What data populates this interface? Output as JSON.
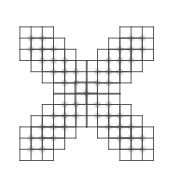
{
  "figure": {
    "canvas": {
      "width": 173,
      "height": 186,
      "background_color": "#ffffff"
    },
    "style": {
      "line_color": "#4a4a4a",
      "line_width": 0.9,
      "dot_color": "#8a8a8a",
      "dot_radius": 2.2,
      "dot_blur": 1.6,
      "cell_size": 11.2
    },
    "center_block": {
      "name": "center-2x2-grid",
      "x": 75.0,
      "y": 82.0,
      "cols": 2,
      "rows": 2,
      "cell": 11.2,
      "dots": 1
    },
    "arms": [
      {
        "name": "arm-top-left",
        "direction": "up-left",
        "dx": -1,
        "dy": -1,
        "blocks": 4
      },
      {
        "name": "arm-top-right",
        "direction": "up-right",
        "dx": 1,
        "dy": -1,
        "blocks": 4
      },
      {
        "name": "arm-bottom-left",
        "direction": "down-left",
        "dx": -1,
        "dy": 1,
        "blocks": 4
      },
      {
        "name": "arm-bottom-right",
        "direction": "down-right",
        "dx": 1,
        "dy": 1,
        "blocks": 4
      }
    ],
    "block_template": {
      "cols": 3,
      "rows": 3,
      "interior_dots": 4,
      "step": 11.2
    },
    "blocks": [
      {
        "name": "tl-block-1",
        "x": 53.5,
        "y": 60.5,
        "cols": 3,
        "rows": 3
      },
      {
        "name": "tl-block-2",
        "x": 42.3,
        "y": 49.3,
        "cols": 3,
        "rows": 3
      },
      {
        "name": "tl-block-3",
        "x": 31.1,
        "y": 38.1,
        "cols": 3,
        "rows": 3
      },
      {
        "name": "tl-block-4",
        "x": 19.9,
        "y": 26.9,
        "cols": 3,
        "rows": 3
      },
      {
        "name": "tr-block-1",
        "x": 86.3,
        "y": 60.5,
        "cols": 3,
        "rows": 3
      },
      {
        "name": "tr-block-2",
        "x": 97.5,
        "y": 49.3,
        "cols": 3,
        "rows": 3
      },
      {
        "name": "tr-block-3",
        "x": 108.7,
        "y": 38.1,
        "cols": 3,
        "rows": 3
      },
      {
        "name": "tr-block-4",
        "x": 119.9,
        "y": 26.9,
        "cols": 3,
        "rows": 3
      },
      {
        "name": "bl-block-1",
        "x": 53.5,
        "y": 93.3,
        "cols": 3,
        "rows": 3
      },
      {
        "name": "bl-block-2",
        "x": 42.3,
        "y": 104.5,
        "cols": 3,
        "rows": 3
      },
      {
        "name": "bl-block-3",
        "x": 31.1,
        "y": 115.7,
        "cols": 3,
        "rows": 3
      },
      {
        "name": "bl-block-4",
        "x": 19.9,
        "y": 126.9,
        "cols": 3,
        "rows": 3
      },
      {
        "name": "br-block-1",
        "x": 86.3,
        "y": 93.3,
        "cols": 3,
        "rows": 3
      },
      {
        "name": "br-block-2",
        "x": 97.5,
        "y": 104.5,
        "cols": 3,
        "rows": 3
      },
      {
        "name": "br-block-3",
        "x": 108.7,
        "y": 115.7,
        "cols": 3,
        "rows": 3
      },
      {
        "name": "br-block-4",
        "x": 119.9,
        "y": 126.9,
        "cols": 3,
        "rows": 3
      }
    ]
  }
}
